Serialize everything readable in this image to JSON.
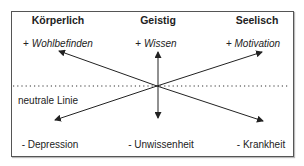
{
  "columns": [
    {
      "header": "Körperlich",
      "positive": "Wohlbefinden",
      "negative": "Depression"
    },
    {
      "header": "Geistig",
      "positive": "Wissen",
      "negative": "Unwissenheit"
    },
    {
      "header": "Seelisch",
      "positive": "Motivation",
      "negative": "Krankheit"
    }
  ],
  "signs": {
    "plus": "+",
    "minus": "-"
  },
  "neutral_line_label": "neutrale Linie",
  "colors": {
    "line": "#222222",
    "border": "#555555"
  }
}
